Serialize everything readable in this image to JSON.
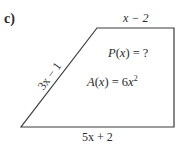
{
  "problem": {
    "label": "c)"
  },
  "shape": {
    "type": "trapezoid",
    "stroke_color": "#3a3a3a",
    "vertices": {
      "top_left": [
        97,
        28
      ],
      "top_right": [
        174,
        28
      ],
      "bottom_right": [
        174,
        127
      ],
      "bottom_left": [
        21,
        127
      ]
    }
  },
  "sides": {
    "top": "x − 2",
    "bottom": "5x + 2",
    "left": "3x − 1"
  },
  "formulas": {
    "perimeter": {
      "func": "P",
      "var": "x",
      "rest": " = ?"
    },
    "area": {
      "func": "A",
      "var": "x",
      "rest": " = 6",
      "power_base": "x",
      "exponent": "2"
    }
  }
}
